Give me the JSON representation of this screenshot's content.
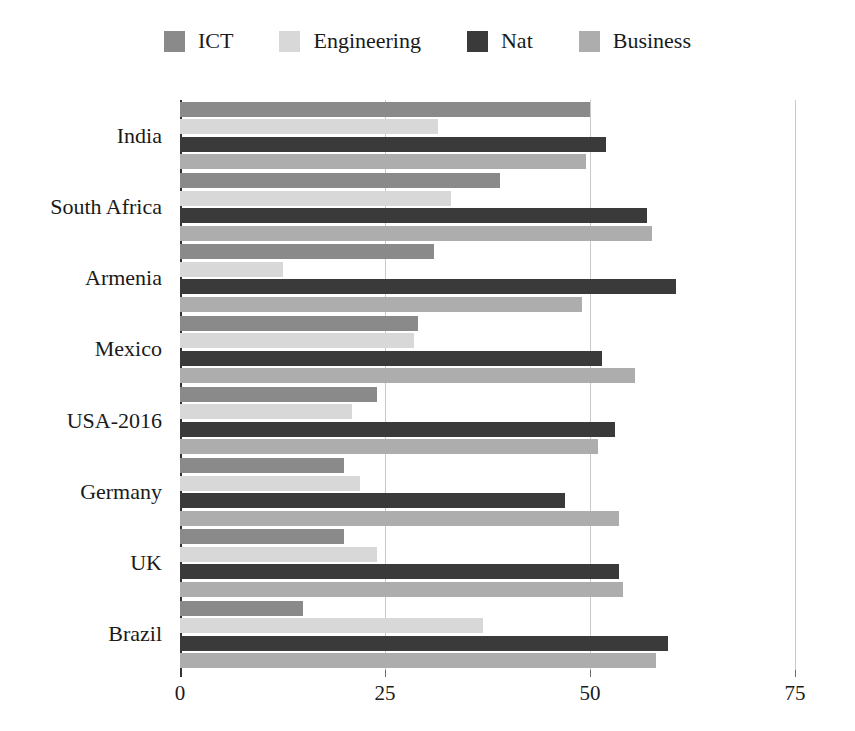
{
  "chart_data": {
    "type": "bar",
    "orientation": "horizontal",
    "title": "",
    "xlabel": "",
    "ylabel": "",
    "xlim": [
      0,
      75
    ],
    "xticks": [
      0,
      25,
      50,
      75
    ],
    "xtick_labels": [
      "0",
      "25",
      "50",
      "75"
    ],
    "grid": true,
    "grid_axis": "x",
    "legend_position": "top-center",
    "categories": [
      "India",
      "South Africa",
      "Armenia",
      "Mexico",
      "USA-2016",
      "Germany",
      "UK",
      "Brazil"
    ],
    "series": [
      {
        "name": "ICT",
        "color": "#8a8a8a",
        "values": [
          50.0,
          39.0,
          31.0,
          29.0,
          24.0,
          20.0,
          20.0,
          15.0
        ]
      },
      {
        "name": "Engineering",
        "color": "#d8d8d8",
        "values": [
          31.5,
          33.0,
          12.5,
          28.5,
          21.0,
          22.0,
          24.0,
          37.0
        ]
      },
      {
        "name": "Nat",
        "color": "#3a3a3a",
        "values": [
          52.0,
          57.0,
          60.5,
          51.5,
          53.0,
          47.0,
          53.5,
          59.5
        ]
      },
      {
        "name": "Business",
        "color": "#adadad",
        "values": [
          49.5,
          57.5,
          49.0,
          55.5,
          51.0,
          53.5,
          54.0,
          58.0
        ]
      }
    ]
  },
  "legend": {
    "entries": [
      {
        "label": "ICT",
        "swatch": "legend-swatch-ict",
        "color": "#8a8a8a"
      },
      {
        "label": "Engineering",
        "swatch": "legend-swatch-engineering",
        "color": "#d8d8d8"
      },
      {
        "label": "Nat",
        "swatch": "legend-swatch-nat",
        "color": "#3a3a3a"
      },
      {
        "label": "Business",
        "swatch": "legend-swatch-business",
        "color": "#adadad"
      }
    ]
  },
  "axis": {
    "x_tick_labels": [
      "0",
      "25",
      "50",
      "75"
    ],
    "y_tick_labels": [
      "India",
      "South Africa",
      "Armenia",
      "Mexico",
      "USA-2016",
      "Germany",
      "UK",
      "Brazil"
    ]
  }
}
